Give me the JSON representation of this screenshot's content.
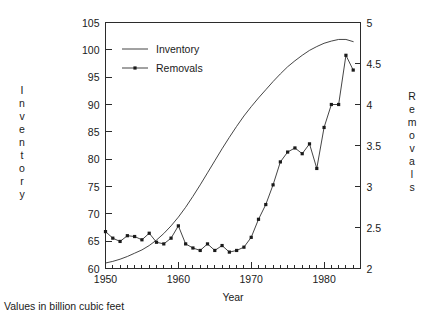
{
  "caption": "Values in billion cubic feet",
  "legend": {
    "position": "top-left-inside",
    "entries": [
      {
        "label": "Inventory",
        "marker": "none",
        "line": "solid"
      },
      {
        "label": "Removals",
        "marker": "square",
        "line": "solid"
      }
    ]
  },
  "axes": {
    "left_title": "Inventory",
    "right_title": "Removals",
    "x_title": "Year",
    "left_ticks": [
      "60",
      "65",
      "70",
      "75",
      "80",
      "85",
      "90",
      "95",
      "100",
      "105"
    ],
    "right_ticks": [
      "2",
      "2.5",
      "3",
      "3.5",
      "4",
      "4.5",
      "5"
    ],
    "x_ticks": [
      "1950",
      "1960",
      "1970",
      "1980"
    ]
  },
  "chart_data": {
    "type": "line",
    "title": "",
    "subtitle": "",
    "xlabel": "Year",
    "ylabel": "Inventory",
    "y2label": "Removals",
    "annotation": "Values in billion cubic feet",
    "grid": false,
    "legend_position": "upper left",
    "xlim": [
      1950,
      1985
    ],
    "ylim": [
      60,
      105
    ],
    "y2lim": [
      2,
      5
    ],
    "ytick_step": 5,
    "y2tick_step": 0.5,
    "xtick_major_step": 10,
    "xtick_minor_step": 1,
    "x": [
      1950,
      1951,
      1952,
      1953,
      1954,
      1955,
      1956,
      1957,
      1958,
      1959,
      1960,
      1961,
      1962,
      1963,
      1964,
      1965,
      1966,
      1967,
      1968,
      1969,
      1970,
      1971,
      1972,
      1973,
      1974,
      1975,
      1976,
      1977,
      1978,
      1979,
      1980,
      1981,
      1982,
      1983,
      1984
    ],
    "series": [
      {
        "name": "Inventory",
        "axis": "left",
        "marker": "none",
        "values": [
          61.0,
          61.3,
          61.7,
          62.2,
          62.8,
          63.4,
          64.2,
          65.2,
          66.4,
          67.8,
          69.4,
          71.2,
          73.2,
          75.3,
          77.5,
          79.7,
          81.9,
          84.0,
          86.0,
          87.9,
          89.6,
          91.2,
          92.7,
          94.2,
          95.6,
          96.9,
          98.0,
          99.0,
          99.9,
          100.6,
          101.2,
          101.6,
          101.9,
          101.9,
          101.5
        ]
      },
      {
        "name": "Removals",
        "axis": "right",
        "marker": "square",
        "values": [
          2.45,
          2.37,
          2.33,
          2.4,
          2.39,
          2.35,
          2.43,
          2.32,
          2.3,
          2.37,
          2.52,
          2.3,
          2.25,
          2.22,
          2.3,
          2.22,
          2.28,
          2.2,
          2.22,
          2.26,
          2.38,
          2.6,
          2.78,
          3.02,
          3.3,
          3.42,
          3.47,
          3.4,
          3.52,
          3.22,
          3.72,
          4.0,
          4.0,
          4.6,
          4.42
        ]
      }
    ]
  }
}
